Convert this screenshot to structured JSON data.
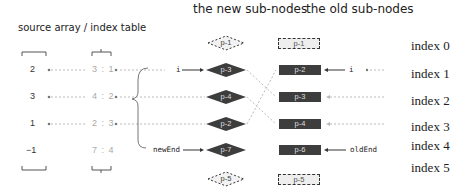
{
  "headers": {
    "left": "source array  /  index table",
    "new_nodes": "the new sub-nodes",
    "old_nodes": "the old sub-nodes"
  },
  "source_array": [
    "2",
    "3",
    "1",
    "−1"
  ],
  "index_table": [
    "3 : 1",
    "4 : 2",
    "2 : 3",
    "7 : 4"
  ],
  "new_nodes": [
    {
      "label": "p-1",
      "state": "ghost"
    },
    {
      "label": "p-3",
      "state": "active"
    },
    {
      "label": "p-4",
      "state": "active"
    },
    {
      "label": "p-2",
      "state": "active"
    },
    {
      "label": "p-7",
      "state": "active"
    },
    {
      "label": "p-5",
      "state": "ghost"
    }
  ],
  "old_nodes": [
    {
      "label": "p-1",
      "state": "ghost"
    },
    {
      "label": "p-2",
      "state": "active"
    },
    {
      "label": "p-3",
      "state": "active"
    },
    {
      "label": "p-4",
      "state": "active"
    },
    {
      "label": "p-6",
      "state": "active"
    },
    {
      "label": "p-5",
      "state": "ghost"
    }
  ],
  "pointers": {
    "new_i": "i",
    "old_i": "i",
    "new_end": "newEnd",
    "old_end": "oldEnd"
  },
  "index_labels": [
    "index 0",
    "index 1",
    "index 2",
    "index 3",
    "index 4",
    "index 5"
  ],
  "colors": {
    "node_fill": "#3d3d3d",
    "ghost_fill": "#eeeeee",
    "dash_line": "#aaaaaa"
  }
}
